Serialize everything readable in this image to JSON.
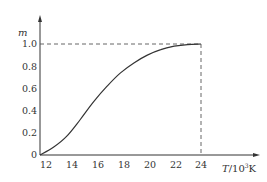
{
  "chart_data": {
    "type": "line",
    "title": "",
    "xlabel": "T/10^3K",
    "xlabel_main": "T",
    "xlabel_unit": "/10",
    "xlabel_exp": "3",
    "xlabel_tail": "K",
    "ylabel": "m",
    "xlim": [
      12,
      24
    ],
    "ylim": [
      0,
      1.0
    ],
    "x_ticks": [
      "12",
      "14",
      "16",
      "18",
      "20",
      "22",
      "24"
    ],
    "y_ticks": [
      "0",
      "0.2",
      "0.4",
      "0.6",
      "0.8",
      "1.0"
    ],
    "grid": false,
    "legend": null,
    "series": [
      {
        "name": "m",
        "x": [
          12,
          13,
          14,
          15,
          16,
          17,
          18,
          19,
          20,
          21,
          22,
          23,
          24
        ],
        "y": [
          0.0,
          0.07,
          0.17,
          0.32,
          0.48,
          0.62,
          0.74,
          0.83,
          0.9,
          0.95,
          0.98,
          0.995,
          1.0
        ]
      }
    ],
    "annotations": [
      {
        "type": "dashed-hline",
        "y": 1.0,
        "x_from": 12,
        "x_to": 24
      },
      {
        "type": "dashed-vline",
        "x": 24,
        "y_from": 0,
        "y_to": 1.0
      }
    ],
    "colors": {
      "axis": "#333333",
      "curve": "#333333",
      "dashed": "#555555"
    }
  }
}
